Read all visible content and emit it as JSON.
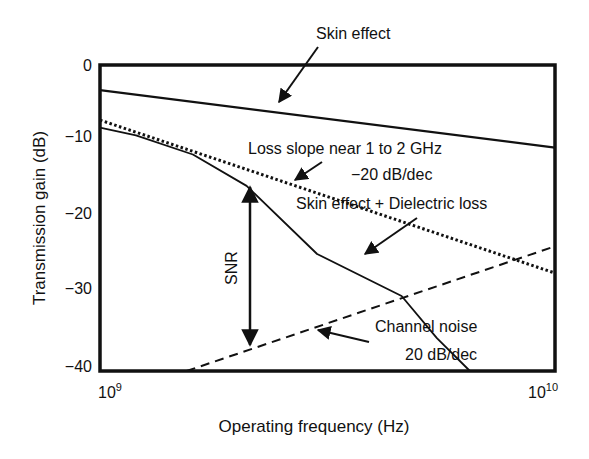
{
  "chart_data": {
    "type": "line",
    "title": "",
    "xlabel": "Operating frequency (Hz)",
    "ylabel": "Transmission gain (dB)",
    "xscale": "log",
    "xlim": [
      1000000000.0,
      10000000000.0
    ],
    "ylim": [
      -40,
      0
    ],
    "x_ticks": [
      {
        "base": "10",
        "exp": "9"
      },
      {
        "base": "10",
        "exp": "10"
      }
    ],
    "y_ticks": [
      "0",
      "−10",
      "−20",
      "−30",
      "−40"
    ],
    "y_tick_values": [
      0,
      -10,
      -20,
      -30,
      -40
    ],
    "grid": false,
    "legend": "none (inline annotations)",
    "series": [
      {
        "name": "Skin effect",
        "style": "solid",
        "x": [
          1000000000.0,
          10000000000.0
        ],
        "y": [
          -3.3,
          -10.8
        ]
      },
      {
        "name": "Loss slope near 1 to 2 GHz −20 dB/dec",
        "style": "dotted",
        "x": [
          1000000000.0,
          10000000000.0
        ],
        "y": [
          -7.2,
          -27.2
        ]
      },
      {
        "name": "Skin effect + Dielectric loss",
        "style": "solid",
        "x": [
          1000000000.0,
          1200000000.0,
          1600000000.0,
          2100000000.0,
          3000000000.0,
          4600000000.0,
          5500000000.0,
          6500000000.0
        ],
        "y": [
          -8.2,
          -9.2,
          -11.7,
          -15.8,
          -24.7,
          -30.2,
          -35.7,
          -40.0
        ]
      },
      {
        "name": "Channel noise 20 dB/dec",
        "style": "dashed",
        "x": [
          1550000000.0,
          10000000000.0
        ],
        "y": [
          -40.0,
          -23.7
        ]
      }
    ],
    "annotations": [
      {
        "text": "Skin effect",
        "arrow_to": [
          2300000000.0,
          -5.5
        ]
      },
      {
        "text": "Loss slope near 1 to 2 GHz",
        "line2": "−20 dB/dec",
        "arrow_to": [
          3000000000.0,
          -15.3
        ]
      },
      {
        "text": "Skin effect + Dielectric loss",
        "arrow_to": [
          3600000000.0,
          -23.7
        ]
      },
      {
        "text": "Channel noise",
        "line2": "20 dB/dec",
        "arrow_to": [
          3300000000.0,
          -34.5
        ]
      },
      {
        "text": "SNR",
        "double_arrow": {
          "x": 2100000000.0,
          "y_top": -15.8,
          "y_bottom": -36.5
        }
      }
    ]
  }
}
